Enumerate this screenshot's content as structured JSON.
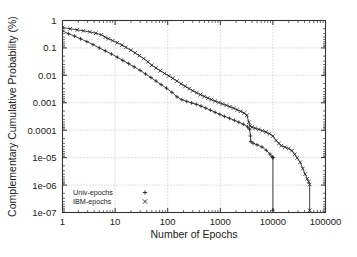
{
  "chart_data": {
    "type": "line",
    "title": "",
    "xlabel": "Number of Epochs",
    "ylabel": "Complementary Cumulative Probability (%)",
    "xscale": "log",
    "yscale": "log",
    "xlim": [
      1,
      100000
    ],
    "ylim": [
      1e-07,
      1
    ],
    "xticks": [
      1,
      10,
      100,
      1000,
      10000,
      100000
    ],
    "xtick_labels": [
      "1",
      "10",
      "100",
      "1000",
      "10000",
      "100000"
    ],
    "yticks": [
      1,
      0.1,
      0.01,
      0.001,
      0.0001,
      1e-05,
      1e-06,
      1e-07
    ],
    "ytick_labels": [
      "1",
      "0.1",
      "0.01",
      "0.001",
      "0.0001",
      "1e-05",
      "1e-06",
      "1e-07"
    ],
    "grid": true,
    "grid_style": "dotted",
    "legend_position": "bottom-left",
    "line_color": "#222222",
    "grid_color": "#aaaaaa",
    "frame_color": "#333333",
    "series": [
      {
        "name": "Univ-epochs",
        "marker": "+",
        "marker_symbol": "plus-marker",
        "points": [
          [
            1,
            0.42
          ],
          [
            1.3,
            0.33
          ],
          [
            1.7,
            0.27
          ],
          [
            2.2,
            0.215
          ],
          [
            2.9,
            0.17
          ],
          [
            3.8,
            0.133
          ],
          [
            5,
            0.1
          ],
          [
            6.5,
            0.078
          ],
          [
            8.5,
            0.06
          ],
          [
            11,
            0.046
          ],
          [
            14,
            0.035
          ],
          [
            18,
            0.027
          ],
          [
            23,
            0.0205
          ],
          [
            30,
            0.0152
          ],
          [
            38,
            0.0112
          ],
          [
            48,
            0.0083
          ],
          [
            60,
            0.0062
          ],
          [
            75,
            0.0046
          ],
          [
            95,
            0.0034
          ],
          [
            120,
            0.0024
          ],
          [
            150,
            0.00165
          ],
          [
            185,
            0.0013
          ],
          [
            230,
            0.00112
          ],
          [
            285,
            0.00099
          ],
          [
            350,
            0.00088
          ],
          [
            430,
            0.00076
          ],
          [
            530,
            0.00064
          ],
          [
            650,
            0.00054
          ],
          [
            800,
            0.00045
          ],
          [
            980,
            0.00038
          ],
          [
            1200,
            0.00032
          ],
          [
            1500,
            0.00027
          ],
          [
            1850,
            0.00023
          ],
          [
            2250,
            0.000195
          ],
          [
            2750,
            0.000165
          ],
          [
            3300,
            0.000132
          ],
          [
            3600,
            0.000108
          ],
          [
            3750,
            6.15e-05
          ],
          [
            3800,
            3.85e-05
          ],
          [
            4200,
            3.35e-05
          ],
          [
            5000,
            2.95e-05
          ],
          [
            6200,
            2.45e-05
          ],
          [
            7500,
            1.85e-05
          ],
          [
            8800,
            1.35e-05
          ],
          [
            9700,
            1.08e-05
          ],
          [
            9950,
            1.01e-05
          ],
          [
            10000,
            1e-05
          ],
          [
            10000,
            1.2e-07
          ]
        ]
      },
      {
        "name": "IBM-epochs",
        "marker": "x",
        "marker_symbol": "cross-marker",
        "points": [
          [
            1,
            0.56
          ],
          [
            1.4,
            0.5
          ],
          [
            1.9,
            0.455
          ],
          [
            2.5,
            0.42
          ],
          [
            3.3,
            0.385
          ],
          [
            4.3,
            0.345
          ],
          [
            5.5,
            0.3
          ],
          [
            6.5,
            0.245
          ],
          [
            7.5,
            0.215
          ],
          [
            9,
            0.185
          ],
          [
            11,
            0.155
          ],
          [
            13.5,
            0.128
          ],
          [
            16,
            0.105
          ],
          [
            20,
            0.083
          ],
          [
            24,
            0.066
          ],
          [
            29,
            0.052
          ],
          [
            35,
            0.041
          ],
          [
            42,
            0.031
          ],
          [
            50,
            0.0235
          ],
          [
            60,
            0.0185
          ],
          [
            72,
            0.0148
          ],
          [
            87,
            0.0118
          ],
          [
            105,
            0.0096
          ],
          [
            125,
            0.0078
          ],
          [
            150,
            0.0062
          ],
          [
            180,
            0.0049
          ],
          [
            215,
            0.004
          ],
          [
            255,
            0.0033
          ],
          [
            300,
            0.00275
          ],
          [
            355,
            0.00232
          ],
          [
            420,
            0.00198
          ],
          [
            495,
            0.0017
          ],
          [
            580,
            0.00148
          ],
          [
            680,
            0.0013
          ],
          [
            800,
            0.00115
          ],
          [
            940,
            0.00102
          ],
          [
            1100,
            0.00091
          ],
          [
            1300,
            0.00081
          ],
          [
            1520,
            0.00072
          ],
          [
            1780,
            0.00064
          ],
          [
            2080,
            0.00056
          ],
          [
            2430,
            0.00049
          ],
          [
            2840,
            0.00042
          ],
          [
            3200,
            0.00035
          ],
          [
            3500,
            0.000195
          ],
          [
            3700,
            0.000142
          ],
          [
            4000,
            0.000129
          ],
          [
            4600,
            0.000118
          ],
          [
            5400,
            0.000107
          ],
          [
            6300,
            9.6e-05
          ],
          [
            7400,
            8.55e-05
          ],
          [
            8600,
            7.4e-05
          ],
          [
            10000,
            6.1e-05
          ],
          [
            11500,
            4.25e-05
          ],
          [
            13000,
            3.3e-05
          ],
          [
            14500,
            2.72e-05
          ],
          [
            17000,
            2.4e-05
          ],
          [
            20000,
            2.15e-05
          ],
          [
            23000,
            1.8e-05
          ],
          [
            26000,
            1.32e-05
          ],
          [
            29000,
            9.8e-06
          ],
          [
            33000,
            6.8e-06
          ],
          [
            37000,
            4e-06
          ],
          [
            41000,
            2.5e-06
          ],
          [
            45000,
            1.7e-06
          ],
          [
            48000,
            1.3e-06
          ],
          [
            50000,
            1.05e-06
          ],
          [
            50000,
            1.2e-07
          ]
        ]
      }
    ]
  }
}
